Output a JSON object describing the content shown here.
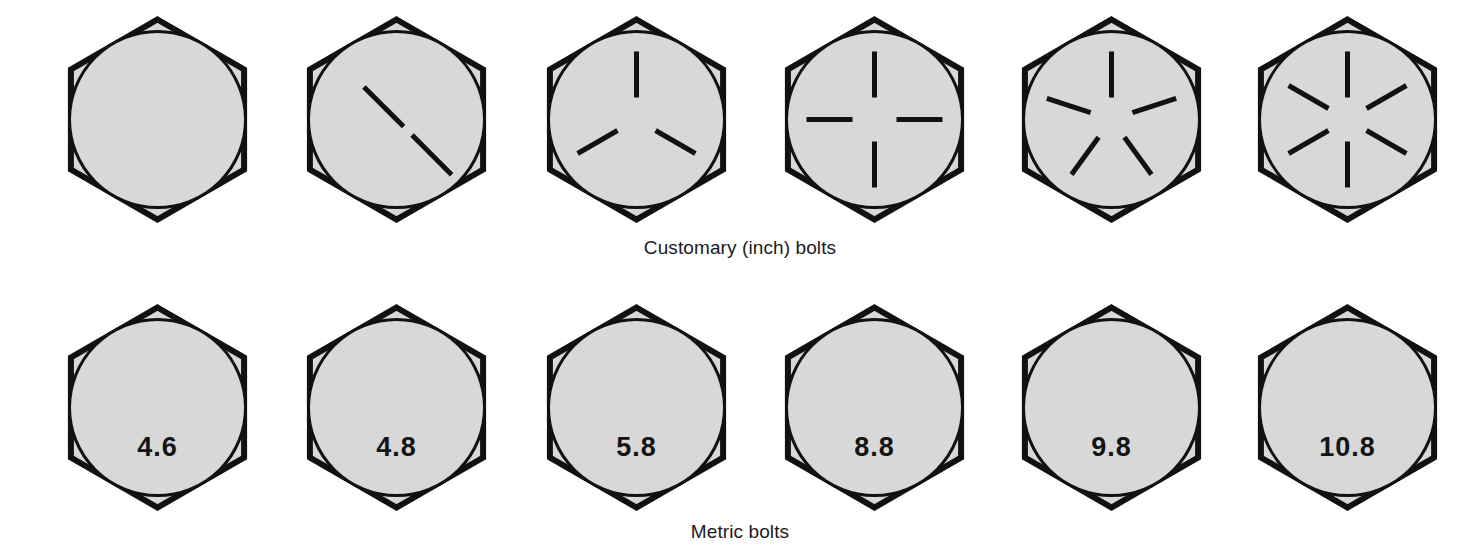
{
  "figure": {
    "background_color": "#ffffff",
    "head_fill_color": "#d8d8d8",
    "outline_color": "#111111"
  },
  "rows": [
    {
      "id": "customary",
      "caption": "Customary (inch) bolts",
      "marking_style": "radial-lines",
      "bolts": [
        {
          "name": "customary-bolt-0-lines",
          "marks": 0,
          "label": ""
        },
        {
          "name": "customary-bolt-2-lines",
          "marks": 2,
          "label": ""
        },
        {
          "name": "customary-bolt-3-lines",
          "marks": 3,
          "label": ""
        },
        {
          "name": "customary-bolt-4-lines",
          "marks": 4,
          "label": ""
        },
        {
          "name": "customary-bolt-5-lines",
          "marks": 5,
          "label": ""
        },
        {
          "name": "customary-bolt-6-lines",
          "marks": 6,
          "label": ""
        }
      ]
    },
    {
      "id": "metric",
      "caption": "Metric bolts",
      "marking_style": "grade-number",
      "bolts": [
        {
          "name": "metric-bolt-4-6",
          "marks": 0,
          "label": "4.6"
        },
        {
          "name": "metric-bolt-4-8",
          "marks": 0,
          "label": "4.8"
        },
        {
          "name": "metric-bolt-5-8",
          "marks": 0,
          "label": "5.8"
        },
        {
          "name": "metric-bolt-8-8",
          "marks": 0,
          "label": "8.8"
        },
        {
          "name": "metric-bolt-9-8",
          "marks": 0,
          "label": "9.8"
        },
        {
          "name": "metric-bolt-10-8",
          "marks": 0,
          "label": "10.8"
        }
      ]
    }
  ],
  "geometry": {
    "column_centers": [
      157,
      396,
      636,
      874,
      1111,
      1347
    ],
    "hex_radius": 100,
    "circle_radius": 88,
    "mark_inner_radius": 22,
    "mark_outer_radius": 68
  }
}
